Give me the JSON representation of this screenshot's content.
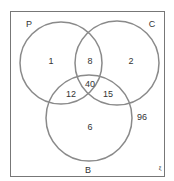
{
  "diagram": {
    "type": "venn",
    "universe_symbol": "ξ",
    "universe_outside": "96",
    "sets": [
      {
        "name": "P",
        "label": "P"
      },
      {
        "name": "C",
        "label": "C"
      },
      {
        "name": "B",
        "label": "B"
      }
    ],
    "regions": {
      "P_only": "1",
      "C_only": "2",
      "B_only": "6",
      "P_and_C_only": "8",
      "P_and_B_only": "12",
      "C_and_B_only": "15",
      "P_C_B": "40"
    },
    "colors": {
      "stroke": "#8a8a8a",
      "border": "#777777",
      "text": "#333333"
    }
  }
}
